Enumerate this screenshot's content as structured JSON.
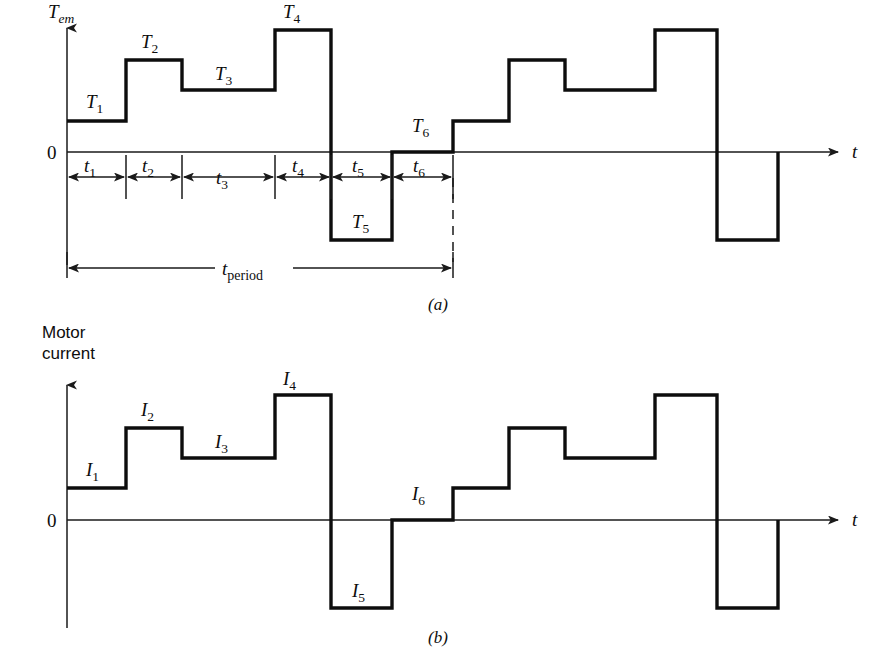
{
  "figure": {
    "caption_a": "(a)",
    "caption_b": "(b)"
  },
  "chart_data": [
    {
      "id": "torque-waveform",
      "type": "line",
      "title": "",
      "ylabel": "T_em",
      "ylabel_base": "T",
      "ylabel_sub": "em",
      "xlabel": "t",
      "zero_label": "0",
      "axis": {
        "grid": false,
        "legend": null,
        "x_origin_px": 67,
        "zero_y_px": 152,
        "x_end_px": 840,
        "y_top_px": 22,
        "y_bottom_px": 265
      },
      "interval_labels": [
        "t1",
        "t2",
        "t3",
        "t4",
        "t5",
        "t6"
      ],
      "interval_label_bases": [
        "t",
        "t",
        "t",
        "t",
        "t",
        "t"
      ],
      "interval_label_subs": [
        "1",
        "2",
        "3",
        "4",
        "5",
        "6"
      ],
      "segment_labels": [
        "T1",
        "T2",
        "T3",
        "T4",
        "T5",
        "T6"
      ],
      "segment_label_bases": [
        "T",
        "T",
        "T",
        "T",
        "T",
        "T"
      ],
      "segment_label_subs": [
        "1",
        "2",
        "3",
        "4",
        "5",
        "6"
      ],
      "period_label_base": "t",
      "period_label_sub": "period",
      "period_label": "t_period",
      "x_breaks_px": [
        67,
        126,
        182,
        275,
        331,
        392,
        453,
        509,
        565,
        655,
        717,
        778
      ],
      "level_y_px": [
        121,
        60,
        90,
        30,
        240,
        152,
        121,
        60,
        90,
        30,
        240
      ],
      "levels_normalized": [
        0.24,
        0.71,
        0.48,
        0.94,
        -0.68,
        0.0
      ],
      "period_bar": {
        "start_px": 67,
        "end_px": 453,
        "y_px": 268
      },
      "dim_row_y_px": 177,
      "tick_marks_px": [
        126,
        182,
        275,
        331,
        392,
        453
      ],
      "dashed_marker_px": 453,
      "label_positions": {
        "T1": [
          86,
          108
        ],
        "T2": [
          141,
          48
        ],
        "T3": [
          215,
          80
        ],
        "T4": [
          283,
          18
        ],
        "T5": [
          352,
          228
        ],
        "T6": [
          412,
          132
        ]
      },
      "interval_label_positions": {
        "t1": [
          90,
          172
        ],
        "t2": [
          148,
          172
        ],
        "t3": [
          222,
          183
        ],
        "t4": [
          296,
          172
        ],
        "t5": [
          354,
          172
        ],
        "t6": [
          415,
          172
        ]
      }
    },
    {
      "id": "motor-current-waveform",
      "type": "line",
      "title": "",
      "ylabel": "Motor current",
      "ylabel_line1": "Motor",
      "ylabel_line2": "current",
      "xlabel": "t",
      "zero_label": "0",
      "axis": {
        "grid": false,
        "legend": null,
        "x_origin_px": 67,
        "zero_y_px": 520,
        "x_end_px": 840,
        "y_top_px": 380,
        "y_bottom_px": 625
      },
      "segment_labels": [
        "I1",
        "I2",
        "I3",
        "I4",
        "I5",
        "I6"
      ],
      "segment_label_bases": [
        "I",
        "I",
        "I",
        "I",
        "I",
        "I"
      ],
      "segment_label_subs": [
        "1",
        "2",
        "3",
        "4",
        "5",
        "6"
      ],
      "x_breaks_px": [
        67,
        126,
        182,
        275,
        331,
        392,
        453,
        509,
        565,
        655,
        717,
        778
      ],
      "level_y_px": [
        488,
        428,
        458,
        395,
        608,
        520,
        488,
        428,
        458,
        395,
        608
      ],
      "levels_normalized": [
        0.26,
        0.74,
        0.5,
        1.0,
        -0.7,
        0.0
      ],
      "label_positions": {
        "I1": [
          86,
          476
        ],
        "I2": [
          141,
          416
        ],
        "I3": [
          215,
          448
        ],
        "I4": [
          283,
          383
        ],
        "I5": [
          352,
          597
        ],
        "I6": [
          412,
          500
        ]
      }
    }
  ]
}
